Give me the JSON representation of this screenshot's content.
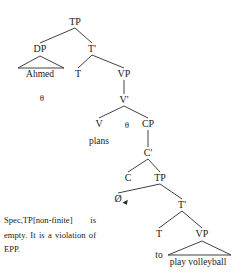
{
  "diagram": {
    "type": "syntax-tree",
    "title": "",
    "nodes": [
      {
        "id": "tp-root",
        "label": "TP",
        "x": 75,
        "y": 22,
        "kind": "category"
      },
      {
        "id": "dp",
        "label": "DP",
        "x": 40,
        "y": 49,
        "kind": "category"
      },
      {
        "id": "tbar",
        "label": "T'",
        "x": 92,
        "y": 49,
        "kind": "category"
      },
      {
        "id": "ahmed",
        "label": "Ahmed",
        "x": 40,
        "y": 74,
        "kind": "leaf"
      },
      {
        "id": "t-head",
        "label": "T",
        "x": 78,
        "y": 74,
        "kind": "category"
      },
      {
        "id": "vp",
        "label": "VP",
        "x": 124,
        "y": 74,
        "kind": "category"
      },
      {
        "id": "theta-1",
        "label": "θ",
        "x": 42,
        "y": 98,
        "kind": "theta"
      },
      {
        "id": "vbar",
        "label": "V'",
        "x": 124,
        "y": 100,
        "kind": "category"
      },
      {
        "id": "v-head",
        "label": "V",
        "x": 99,
        "y": 124,
        "kind": "category"
      },
      {
        "id": "theta-2",
        "label": "θ",
        "x": 127,
        "y": 125,
        "kind": "theta"
      },
      {
        "id": "cp",
        "label": "CP",
        "x": 148,
        "y": 124,
        "kind": "category"
      },
      {
        "id": "plans",
        "label": "plans",
        "x": 99,
        "y": 141,
        "kind": "leaf"
      },
      {
        "id": "cbar",
        "label": "C'",
        "x": 148,
        "y": 153,
        "kind": "category"
      },
      {
        "id": "c-head",
        "label": "C",
        "x": 128,
        "y": 178,
        "kind": "category"
      },
      {
        "id": "tp-lower",
        "label": "TP",
        "x": 160,
        "y": 178,
        "kind": "category"
      },
      {
        "id": "null-c",
        "label": "Ø",
        "x": 118,
        "y": 199,
        "kind": "null-head"
      },
      {
        "id": "tbar-lower",
        "label": "T'",
        "x": 182,
        "y": 205,
        "kind": "category"
      },
      {
        "id": "t-lower",
        "label": "T",
        "x": 159,
        "y": 234,
        "kind": "category"
      },
      {
        "id": "vp-lower",
        "label": "VP",
        "x": 202,
        "y": 234,
        "kind": "category"
      },
      {
        "id": "to",
        "label": "to",
        "x": 159,
        "y": 255,
        "kind": "leaf"
      },
      {
        "id": "play-vb",
        "label": "play volleyball",
        "x": 198,
        "y": 262,
        "kind": "leaf"
      }
    ],
    "edges": [
      {
        "from": "tp-root",
        "to": "dp",
        "style": "branch"
      },
      {
        "from": "tp-root",
        "to": "tbar",
        "style": "branch"
      },
      {
        "from": "tbar",
        "to": "t-head",
        "style": "branch"
      },
      {
        "from": "tbar",
        "to": "vp",
        "style": "branch"
      },
      {
        "from": "vp",
        "to": "vbar",
        "style": "stem"
      },
      {
        "from": "vbar",
        "to": "v-head",
        "style": "branch"
      },
      {
        "from": "vbar",
        "to": "cp",
        "style": "branch"
      },
      {
        "from": "cp",
        "to": "cbar",
        "style": "stem"
      },
      {
        "from": "cbar",
        "to": "c-head",
        "style": "branch"
      },
      {
        "from": "cbar",
        "to": "tp-lower",
        "style": "branch"
      },
      {
        "from": "tp-lower",
        "to": "null-c",
        "style": "branch"
      },
      {
        "from": "tp-lower",
        "to": "tbar-lower",
        "style": "branch"
      },
      {
        "from": "tbar-lower",
        "to": "t-lower",
        "style": "branch"
      },
      {
        "from": "tbar-lower",
        "to": "vp-lower",
        "style": "branch"
      }
    ],
    "triangles": [
      {
        "id": "dp-triangle",
        "apex_x": 40,
        "apex_y": 56,
        "left_x": 18,
        "right_x": 64,
        "base_y": 68
      },
      {
        "id": "vp-triangle",
        "apex_x": 202,
        "apex_y": 241,
        "left_x": 168,
        "right_x": 231,
        "base_y": 255
      }
    ],
    "markers": [
      {
        "id": "epp-arrow",
        "x": 126,
        "y": 203
      }
    ]
  },
  "caption": {
    "text": "Spec,TP[non-finite] is empty. It is a violation of EPP."
  },
  "colors": {
    "stroke": "#2b2b2b",
    "text": "#1a1a1a",
    "background": "#ffffff"
  }
}
